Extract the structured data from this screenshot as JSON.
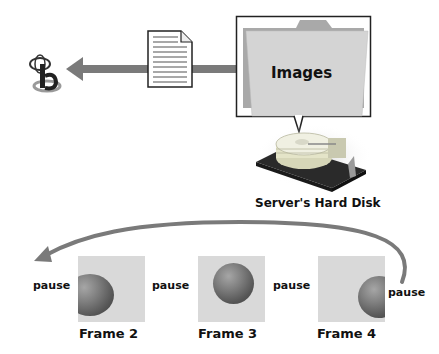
{
  "diagram": {
    "folder_label": "Images",
    "disk_label": "Server's Hard Disk",
    "icons": {
      "browser": "browser-icon",
      "document": "document-icon",
      "folder": "folder-icon",
      "hard_disk": "hard-disk-icon"
    },
    "colors": {
      "arrow": "#7a7a7a",
      "folder": "#d4d4d4",
      "folder_back": "#a9a9a9",
      "frame_bg": "#d9d9d9",
      "text": "#111111"
    },
    "frames": [
      {
        "label": "Frame 2",
        "pause_before": "pause"
      },
      {
        "label": "Frame 3",
        "pause_before": "pause"
      },
      {
        "label": "Frame 4",
        "pause_before": "pause"
      }
    ],
    "pause_after_last": "pause"
  }
}
